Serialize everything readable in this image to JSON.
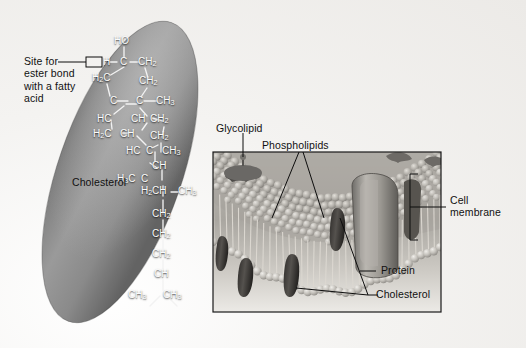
{
  "figure": {
    "kind": "biology-diagram",
    "background_color": "#f2f1ef"
  },
  "cholesterol_panel": {
    "capsule_color": "#8e8e8e",
    "molecule_name_label": "Cholesterol",
    "ester_site_label": "Site for\nester bond\nwith a fatty\nacid",
    "atoms": {
      "a_ho": "HO",
      "a_h": "H",
      "a_c1": "C",
      "a_ch2_1": "CH",
      "a_ch2_1_sub": "2",
      "a_h2c_1": "H",
      "a_h2c_1_sub": "2",
      "a_h2c_1_tail": "C",
      "a_ch2_2": "CH",
      "a_ch2_2_sub": "2",
      "a_c2": "C",
      "a_c3": "C",
      "a_ch3_1": "CH",
      "a_ch3_1_sub": "3",
      "a_hc_1": "HC",
      "a_ch_1": "CH",
      "a_ch2_3": "CH",
      "a_ch2_3_sub": "2",
      "a_h2c_2": "H",
      "a_h2c_2_sub": "2",
      "a_h2c_2_tail": "C",
      "a_ch_2": "CH",
      "a_ch2_4": "CH",
      "a_ch2_4_sub": "2",
      "a_hc_2": "HC",
      "a_c4": "C",
      "a_ch3_2": "CH",
      "a_ch3_2_sub": "3",
      "a_ch_3": "CH",
      "a_h3c_1": "H",
      "a_h3c_1_sub": "3",
      "a_h3c_1_tail": "C",
      "a_c5": "C",
      "a_h2_low": "H",
      "a_h2_low_sub": "2",
      "a_ch_4": "CH",
      "a_ch3_3": "CH",
      "a_ch3_3_sub": "3",
      "a_ch2_5": "CH",
      "a_ch2_5_sub": "2",
      "a_ch2_6": "CH",
      "a_ch2_6_sub": "2",
      "a_ch2_7": "CH",
      "a_ch2_7_sub": "2",
      "a_ch_5": "CH",
      "a_ch3_4": "CH",
      "a_ch3_4_sub": "3",
      "a_ch3_5": "CH",
      "a_ch3_5_sub": "3"
    }
  },
  "membrane_panel": {
    "border_color": "#1a1a1a",
    "labels": {
      "glycolipid": "Glycolipid",
      "phospholipids": "Phospholipids",
      "protein": "Protein",
      "cholesterol": "Cholesterol",
      "cell_membrane": "Cell\nmembrane"
    }
  }
}
